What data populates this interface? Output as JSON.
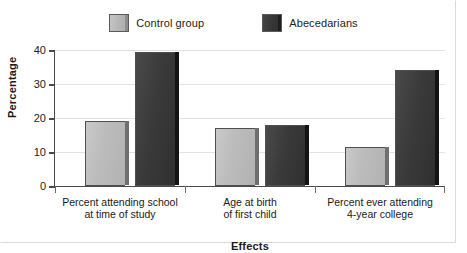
{
  "chart_data": {
    "type": "bar",
    "title": "",
    "xlabel": "Effects",
    "ylabel": "Percentage",
    "categories": [
      "Percent attending school\nat time of study",
      "Age at birth\nof first child",
      "Percent ever attending\n4-year college"
    ],
    "category_lines": [
      [
        "Percent attending school",
        "at time of study"
      ],
      [
        "Age at birth",
        "of first child"
      ],
      [
        "Percent ever attending",
        "4-year college"
      ]
    ],
    "series": [
      {
        "name": "Control group",
        "color": "#b8b8b8",
        "values": [
          19,
          17,
          11.5
        ]
      },
      {
        "name": "Abecedarians",
        "color": "#3a3a3a",
        "values": [
          39.5,
          18,
          34
        ]
      }
    ],
    "ylim": [
      0,
      40
    ],
    "yticks": [
      0,
      10,
      20,
      30,
      40
    ],
    "ytick_labels": [
      "0",
      "10",
      "20",
      "30",
      "40"
    ],
    "grid": true,
    "legend_position": "top-center"
  },
  "legend": {
    "items": [
      {
        "label": "Control group",
        "swatch": "legend-swatch-control"
      },
      {
        "label": "Abecedarians",
        "swatch": "legend-swatch-abecedarians"
      }
    ]
  },
  "axes": {
    "y_title": "Percentage",
    "x_title": "Effects",
    "y_ticks": [
      "0",
      "10",
      "20",
      "30",
      "40"
    ]
  }
}
